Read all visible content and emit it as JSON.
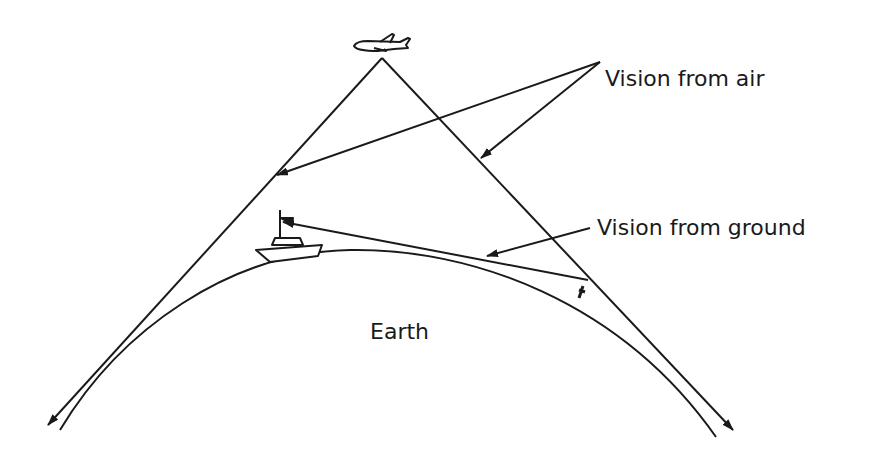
{
  "diagram": {
    "labels": {
      "vision_air": "Vision from air",
      "vision_ground": "Vision from ground",
      "earth": "Earth"
    },
    "elements": {
      "aircraft": "airplane-icon",
      "ship": "ship-icon",
      "angle_mark": "angle-marker"
    },
    "colors": {
      "ink": "#1a1a1a",
      "background": "#ffffff"
    }
  }
}
